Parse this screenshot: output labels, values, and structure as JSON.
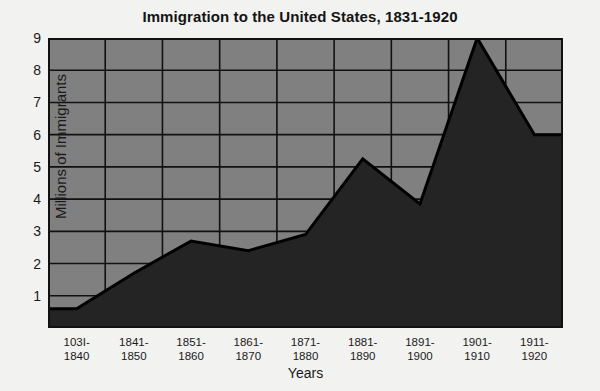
{
  "chart_data": {
    "type": "area",
    "title": "Immigration to the United States, 1831-1920",
    "xlabel": "Years",
    "ylabel": "Millions of Immigrants",
    "categories": [
      "103I-\n1840",
      "1841-\n1850",
      "1851-\n1860",
      "1861-\n1870",
      "1871-\n1880",
      "1881-\n1890",
      "1891-\n1900",
      "1901-\n1910",
      "1911-\n1920"
    ],
    "category_lines": [
      [
        "103I-",
        "1840"
      ],
      [
        "1841-",
        "1850"
      ],
      [
        "1851-",
        "1860"
      ],
      [
        "1861-",
        "1870"
      ],
      [
        "1871-",
        "1880"
      ],
      [
        "1881-",
        "1890"
      ],
      [
        "1891-",
        "1900"
      ],
      [
        "1901-",
        "1910"
      ],
      [
        "1911-",
        "1920"
      ]
    ],
    "values": [
      0.6,
      1.7,
      2.7,
      2.4,
      2.9,
      5.25,
      3.85,
      9.0,
      6.0
    ],
    "ylim": [
      0,
      9
    ],
    "yticks": [
      1,
      2,
      3,
      4,
      5,
      6,
      7,
      8,
      9
    ],
    "ytick_labels": [
      "1",
      "2",
      "3",
      "4",
      "5",
      "6",
      "7",
      "8",
      "9"
    ],
    "grid": true,
    "legend": "none",
    "colors": {
      "plot_background": "#808080",
      "area_fill": "#242424",
      "grid_line": "#111111",
      "series_line": "#000000",
      "page_background": "#f2f2f0",
      "text": "#1a1a1a"
    }
  }
}
